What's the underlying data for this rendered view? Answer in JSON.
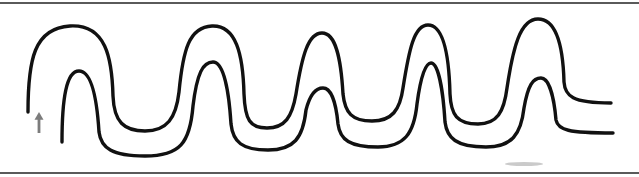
{
  "figure": {
    "background_color": "#ffffff",
    "width": 639,
    "height": 177,
    "alt_text": "A long serpentine double-line path winding up and down across the frame, open at the left and right ends, with a small gray upward arrow marking the entrance at the lower left."
  },
  "borders": {
    "top_rule": {
      "name": "top-border-rule",
      "color": "#5a5a5a",
      "y": 3,
      "x1": 0,
      "x2": 639,
      "thickness": 2
    },
    "bottom_rule": {
      "name": "bottom-border-rule",
      "color": "#5a5a5a",
      "y": 173,
      "x1": 0,
      "x2": 639,
      "thickness": 2
    }
  },
  "path_drawing": {
    "stroke_color": "#111111",
    "stroke_width": 3.4,
    "outer_line": {
      "name": "outer-path-line",
      "start_point": [
        28,
        112
      ],
      "end_point": [
        611,
        103
      ],
      "peak_count": 5,
      "peak_x_positions": [
        70,
        210,
        320,
        425,
        535
      ],
      "peak_y_positions": [
        24,
        26,
        32,
        24,
        18
      ],
      "valley_x_positions": [
        145,
        268,
        375,
        482
      ],
      "valley_y_positions": [
        124,
        115,
        110,
        112
      ],
      "d": "M 28,112 C 28,60 34,28 70,26 C 106,24 112,58 113,96 C 114,122 124,131 145,131 C 167,131 176,118 179,92 C 183,50 189,27 212,26 C 236,25 243,54 244,94 C 245,120 250,128 267,128 C 285,128 292,117 296,94 C 302,56 308,33 322,33 C 336,33 341,59 343,94 C 345,113 352,121 372,121 C 392,121 400,110 403,88 C 409,50 414,25 428,25 C 443,25 449,54 450,94 C 451,115 457,124 478,124 C 497,124 504,112 507,88 C 513,48 520,19 538,19 C 556,19 563,45 564,82 C 565,96 572,103 611,103"
    },
    "inner_line": {
      "name": "inner-path-line",
      "start_point": [
        62,
        142
      ],
      "end_point": [
        613,
        133
      ],
      "peak_count": 5,
      "peak_x_positions": [
        78,
        212,
        322,
        430,
        540
      ],
      "peak_y_positions": [
        70,
        62,
        88,
        62,
        78
      ],
      "valley_x_positions": [
        145,
        268,
        378,
        486
      ],
      "valley_y_positions": [
        150,
        144,
        138,
        142
      ],
      "d": "M 62,142 C 62,100 66,71 79,71 C 92,71 97,100 99,132 C 101,148 112,156 145,156 C 180,156 190,143 193,106 C 197,73 203,62 213,62 C 224,62 229,92 231,124 C 233,142 242,150 268,150 C 294,150 303,138 306,110 C 310,94 316,88 323,88 C 331,88 336,102 338,124 C 340,140 350,147 378,147 C 404,147 414,134 417,104 C 421,74 426,63 431,63 C 438,63 443,89 445,122 C 447,138 456,147 486,147 C 512,147 521,134 524,108 C 528,85 533,78 541,78 C 549,78 554,97 556,120 C 558,130 568,133 613,133"
    }
  },
  "markers": {
    "entrance_arrow": {
      "name": "entrance-arrow-marker",
      "color": "#7c7c7c",
      "direction": "up",
      "x": 39,
      "y": 112,
      "height": 21,
      "width": 9
    },
    "bottom_smudge": {
      "name": "bottom-page-smudge",
      "color": "#b8b8b8",
      "x": 505,
      "y": 162,
      "width": 38,
      "height": 4
    }
  }
}
